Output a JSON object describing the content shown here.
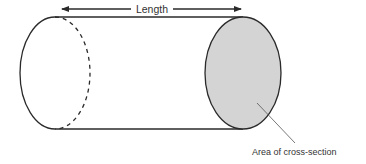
{
  "diagram": {
    "length_label": "Length",
    "cross_section_label": "Area of cross-section",
    "colors": {
      "stroke": "#2a2a2a",
      "cross_section_fill": "#d4d4d4",
      "leader_line": "#555555",
      "text": "#333333",
      "background": "#ffffff"
    },
    "shapes": {
      "left_end": {
        "cx": 55,
        "cy": 73,
        "rx": 35,
        "ry": 56,
        "back_half": "dashed"
      },
      "right_end": {
        "cx": 243,
        "cy": 73,
        "rx": 38,
        "ry": 56,
        "filled": true
      },
      "length_arrow": {
        "x1": 61,
        "x2": 242,
        "y": 9
      }
    }
  }
}
